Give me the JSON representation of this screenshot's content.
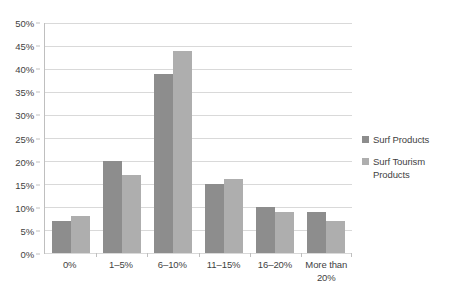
{
  "chart_data": {
    "type": "bar",
    "title": "",
    "subtitle": "",
    "xlabel": "",
    "ylabel": "",
    "categories": [
      "0%",
      "1–5%",
      "6–10%",
      "11–15%",
      "16–20%",
      "More than 20%"
    ],
    "series": [
      {
        "name": "Surf Products",
        "values": [
          7,
          20,
          39,
          15,
          10,
          9
        ]
      },
      {
        "name": "Surf Tourism Products",
        "values": [
          8,
          17,
          44,
          16,
          9,
          7
        ]
      }
    ],
    "ylim": [
      0,
      50
    ],
    "ytick_step": 5,
    "ytick_labels": [
      "0%",
      "5%",
      "10%",
      "15%",
      "20%",
      "25%",
      "30%",
      "35%",
      "40%",
      "45%",
      "50%"
    ],
    "grid": true,
    "legend_position": "right",
    "colors": {
      "series_0": "#8d8d8d",
      "series_1": "#aeaeae",
      "gridline": "#d9d9d9",
      "axis": "#bfbfbf",
      "text": "#3f3f3f",
      "background": "#ffffff"
    }
  },
  "legend": {
    "items": [
      {
        "label": "Surf Products"
      },
      {
        "label": "Surf Tourism Products"
      }
    ]
  }
}
